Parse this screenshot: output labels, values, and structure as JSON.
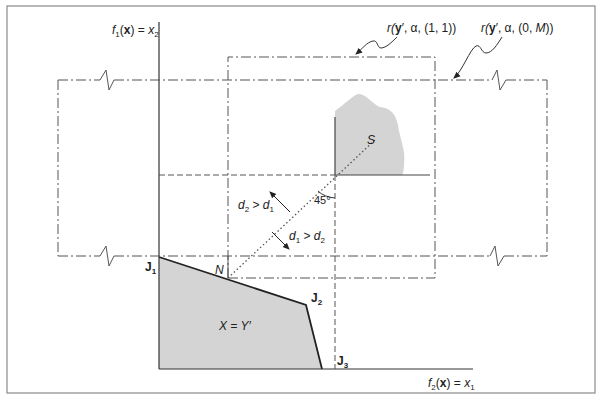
{
  "figure": {
    "axes": {
      "vertical_label_parts": [
        "f",
        "1",
        "(",
        "x",
        ") = ",
        "x",
        "2"
      ],
      "horizontal_label_parts": [
        "f",
        "2",
        "(",
        "x",
        ") = ",
        "x",
        "1"
      ]
    },
    "callouts": {
      "r_11": {
        "prefix": "r(",
        "y": "y",
        "mid": "′, α, (1, 1))"
      },
      "r_0M": {
        "prefix": "r(",
        "y": "y",
        "mid": "′, α, (0, ",
        "M": "M",
        "suffix": "))"
      }
    },
    "points": {
      "J1": {
        "letter": "J",
        "sub": "1"
      },
      "J2": {
        "letter": "J",
        "sub": "2"
      },
      "J3": {
        "letter": "J",
        "sub": "3"
      },
      "N": "N",
      "S": "S"
    },
    "region_label": "X = Y′",
    "angle_label": "45°",
    "direction_labels": {
      "up": {
        "a": "d",
        "a_sub": "2",
        "op": " > ",
        "b": "d",
        "b_sub": "1"
      },
      "down": {
        "a": "d",
        "a_sub": "1",
        "op": " > ",
        "b": "d",
        "b_sub": "2"
      }
    },
    "colors": {
      "region_fill": "#d4d4d4",
      "line": "#222222",
      "dash_line": "#555555",
      "frame": "#777777"
    }
  }
}
